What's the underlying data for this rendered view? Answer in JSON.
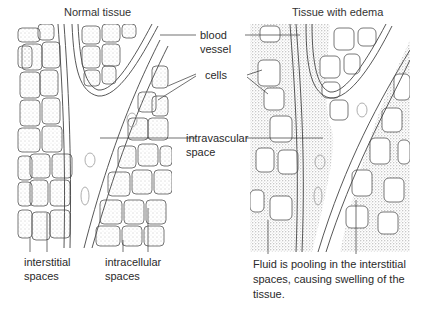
{
  "titles": {
    "left": "Normal tissue",
    "right": "Tissue with edema"
  },
  "labels": {
    "blood_vessel_1": "blood",
    "blood_vessel_2": "vessel",
    "cells": "cells",
    "intravascular_1": "intravascular",
    "intravascular_2": "space",
    "interstitial_1": "interstitial",
    "interstitial_2": "spaces",
    "intracellular_1": "intracellular",
    "intracellular_2": "spaces"
  },
  "caption": {
    "line1": "Fluid is pooling in the interstitial",
    "line2": "spaces, causing swelling of the",
    "line3": "tissue."
  }
}
